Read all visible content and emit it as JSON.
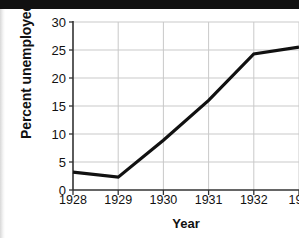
{
  "figure": {
    "width": 299,
    "height": 238,
    "background": "#ffffff",
    "scan_artifact_top_bar_color": "#111111"
  },
  "chart_data": {
    "type": "line",
    "title": "",
    "xlabel": "Year",
    "ylabel": "Percent unemployed",
    "x": [
      1928,
      1929,
      1930,
      1931,
      1932,
      1933
    ],
    "values": [
      3.2,
      2.3,
      8.9,
      16.0,
      24.3,
      25.5
    ],
    "series": [
      {
        "name": "Percent unemployed",
        "values": [
          3.2,
          2.3,
          8.9,
          16.0,
          24.3,
          25.5
        ],
        "color": "#111111",
        "line_width": 3.2
      }
    ],
    "categories": [
      "1928",
      "1929",
      "1930",
      "1931",
      "1932",
      "1933"
    ],
    "xtick_labels": [
      "1928",
      "1929",
      "1930",
      "1931",
      "1932",
      "193"
    ],
    "ytick_labels": [
      "0",
      "5",
      "10",
      "15",
      "20",
      "25",
      "30"
    ],
    "ytick_values": [
      0,
      5,
      10,
      15,
      20,
      25,
      30
    ],
    "xlim": [
      1928,
      1933
    ],
    "ylim": [
      0,
      30
    ],
    "grid": true,
    "grid_color": "#c9c9c9",
    "axis_color": "#333333",
    "legend": "none"
  }
}
